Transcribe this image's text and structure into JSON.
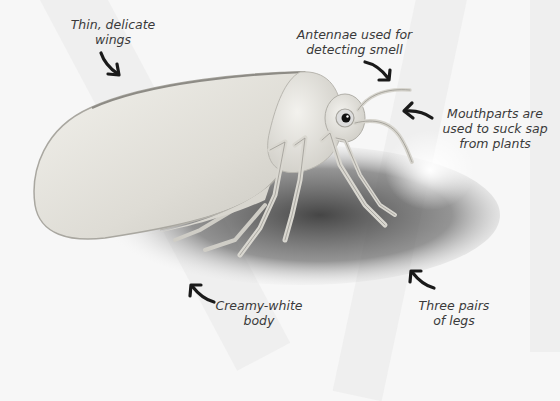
{
  "figure": {
    "colors": {
      "background": "#f7f7f7",
      "label_text": "#3a3a3a",
      "arrow": "#1a1a1a",
      "body": "#e4e2dc",
      "shadow": "#4a4a4a"
    }
  },
  "labels": [
    {
      "id": "wings",
      "lines": [
        "Thin, delicate",
        "wings"
      ]
    },
    {
      "id": "antennae",
      "lines": [
        "Antennae used for",
        "detecting smell"
      ]
    },
    {
      "id": "mouthparts",
      "lines": [
        "Mouthparts are",
        "used to suck sap",
        "from plants"
      ]
    },
    {
      "id": "body",
      "lines": [
        "Creamy-white",
        "body"
      ]
    },
    {
      "id": "legs",
      "lines": [
        "Three pairs",
        "of legs"
      ]
    }
  ]
}
